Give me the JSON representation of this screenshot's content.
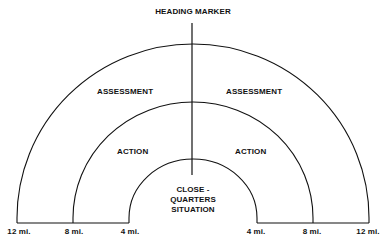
{
  "diagram": {
    "title": "HEADING MARKER",
    "zones": {
      "outer_left": "ASSESSMENT",
      "outer_right": "ASSESSMENT",
      "middle_left": "ACTION",
      "middle_right": "ACTION",
      "inner_line1": "CLOSE -",
      "inner_line2": "QUARTERS",
      "inner_line3": "SITUATION"
    },
    "distance_labels": {
      "left": [
        "12 mi.",
        "8 mi.",
        "4 mi."
      ],
      "right": [
        "4 mi.",
        "8 mi.",
        "12 mi."
      ]
    },
    "colors": {
      "line": "#111111",
      "background": "#ffffff"
    }
  }
}
